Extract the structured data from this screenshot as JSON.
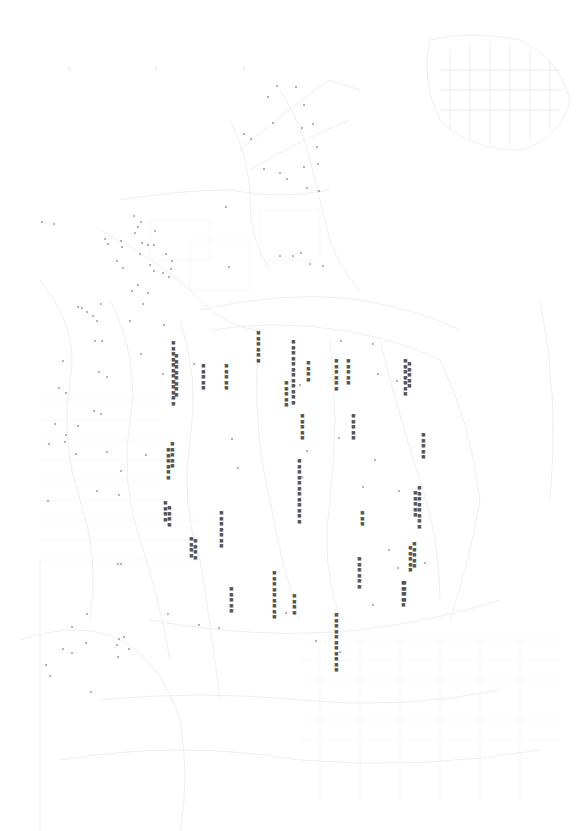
{
  "map": {
    "title": "",
    "background": "#ffffff",
    "line_color": "#e4e4e4",
    "text_color": "#555555",
    "marker_color": "#9a9a9a",
    "top_ticks": [
      {
        "x": 68,
        "y": 66,
        "text": "┼"
      },
      {
        "x": 155,
        "y": 66,
        "text": "┼"
      },
      {
        "x": 243,
        "y": 66,
        "text": "┼"
      }
    ],
    "labels": [
      {
        "x": 171,
        "y": 340,
        "text": "■■■■■■■■■■■■"
      },
      {
        "x": 174,
        "y": 353,
        "text": "■■■■■■■■"
      },
      {
        "x": 201,
        "y": 363,
        "text": "■■■■■"
      },
      {
        "x": 224,
        "y": 363,
        "text": "■■■■■"
      },
      {
        "x": 256,
        "y": 330,
        "text": "■■■■■■"
      },
      {
        "x": 284,
        "y": 380,
        "text": "■■■■■"
      },
      {
        "x": 291,
        "y": 339,
        "text": "■■■■■■■■■■■■"
      },
      {
        "x": 306,
        "y": 360,
        "text": "■■■■"
      },
      {
        "x": 300,
        "y": 413,
        "text": "■■■■■"
      },
      {
        "x": 334,
        "y": 358,
        "text": "■■■■■■"
      },
      {
        "x": 346,
        "y": 358,
        "text": "■■■■■"
      },
      {
        "x": 351,
        "y": 413,
        "text": "■■■■■"
      },
      {
        "x": 403,
        "y": 358,
        "text": "■■■■■■■"
      },
      {
        "x": 407,
        "y": 361,
        "text": "■■■■■"
      },
      {
        "x": 421,
        "y": 432,
        "text": "■■■■■"
      },
      {
        "x": 297,
        "y": 458,
        "text": "■■■■■■■■■■■■"
      },
      {
        "x": 417,
        "y": 485,
        "text": "■■■■■■■■"
      },
      {
        "x": 413,
        "y": 490,
        "text": "■■■■■"
      },
      {
        "x": 412,
        "y": 541,
        "text": "■■■■■"
      },
      {
        "x": 408,
        "y": 545,
        "text": "■■■■■"
      },
      {
        "x": 360,
        "y": 510,
        "text": "■■■"
      },
      {
        "x": 357,
        "y": 556,
        "text": "■■■■■■"
      },
      {
        "x": 401,
        "y": 580,
        "text": "■■■■■"
      },
      {
        "x": 166,
        "y": 447,
        "text": "■■■■■■"
      },
      {
        "x": 170,
        "y": 441,
        "text": "■■■■■"
      },
      {
        "x": 167,
        "y": 505,
        "text": "■■■■"
      },
      {
        "x": 163,
        "y": 500,
        "text": "■■■■"
      },
      {
        "x": 219,
        "y": 510,
        "text": "■■■■■■■"
      },
      {
        "x": 193,
        "y": 538,
        "text": "■■■■"
      },
      {
        "x": 189,
        "y": 536,
        "text": "■■■■"
      },
      {
        "x": 272,
        "y": 570,
        "text": "■■■■■■■■■"
      },
      {
        "x": 229,
        "y": 586,
        "text": "■■■■■"
      },
      {
        "x": 292,
        "y": 593,
        "text": "■■■■"
      },
      {
        "x": 334,
        "y": 612,
        "text": "■■■■■■■■■■■"
      },
      {
        "x": 402,
        "y": 580,
        "text": "■■■■"
      }
    ],
    "markers": [
      {
        "x": 276,
        "y": 85
      },
      {
        "x": 295,
        "y": 86
      },
      {
        "x": 267,
        "y": 96
      },
      {
        "x": 303,
        "y": 104
      },
      {
        "x": 272,
        "y": 122
      },
      {
        "x": 301,
        "y": 127
      },
      {
        "x": 312,
        "y": 123
      },
      {
        "x": 243,
        "y": 133
      },
      {
        "x": 250,
        "y": 138
      },
      {
        "x": 316,
        "y": 146
      },
      {
        "x": 263,
        "y": 168
      },
      {
        "x": 303,
        "y": 166
      },
      {
        "x": 317,
        "y": 163
      },
      {
        "x": 279,
        "y": 172
      },
      {
        "x": 286,
        "y": 178
      },
      {
        "x": 306,
        "y": 187
      },
      {
        "x": 318,
        "y": 190
      },
      {
        "x": 225,
        "y": 206
      },
      {
        "x": 279,
        "y": 255
      },
      {
        "x": 292,
        "y": 255
      },
      {
        "x": 300,
        "y": 252
      },
      {
        "x": 309,
        "y": 263
      },
      {
        "x": 322,
        "y": 265
      },
      {
        "x": 228,
        "y": 266
      },
      {
        "x": 41,
        "y": 221
      },
      {
        "x": 53,
        "y": 223
      },
      {
        "x": 133,
        "y": 215
      },
      {
        "x": 140,
        "y": 221
      },
      {
        "x": 137,
        "y": 226
      },
      {
        "x": 134,
        "y": 232
      },
      {
        "x": 154,
        "y": 230
      },
      {
        "x": 104,
        "y": 238
      },
      {
        "x": 107,
        "y": 243
      },
      {
        "x": 120,
        "y": 240
      },
      {
        "x": 141,
        "y": 242
      },
      {
        "x": 147,
        "y": 244
      },
      {
        "x": 153,
        "y": 244
      },
      {
        "x": 121,
        "y": 246
      },
      {
        "x": 139,
        "y": 253
      },
      {
        "x": 165,
        "y": 253
      },
      {
        "x": 116,
        "y": 260
      },
      {
        "x": 122,
        "y": 267
      },
      {
        "x": 149,
        "y": 264
      },
      {
        "x": 171,
        "y": 260
      },
      {
        "x": 170,
        "y": 268
      },
      {
        "x": 153,
        "y": 270
      },
      {
        "x": 162,
        "y": 272
      },
      {
        "x": 168,
        "y": 276
      },
      {
        "x": 137,
        "y": 284
      },
      {
        "x": 131,
        "y": 290
      },
      {
        "x": 147,
        "y": 292
      },
      {
        "x": 100,
        "y": 303
      },
      {
        "x": 77,
        "y": 306
      },
      {
        "x": 142,
        "y": 303
      },
      {
        "x": 81,
        "y": 307
      },
      {
        "x": 86,
        "y": 311
      },
      {
        "x": 92,
        "y": 315
      },
      {
        "x": 96,
        "y": 320
      },
      {
        "x": 129,
        "y": 320
      },
      {
        "x": 163,
        "y": 324
      },
      {
        "x": 94,
        "y": 340
      },
      {
        "x": 101,
        "y": 340
      },
      {
        "x": 140,
        "y": 353
      },
      {
        "x": 62,
        "y": 360
      },
      {
        "x": 98,
        "y": 371
      },
      {
        "x": 106,
        "y": 376
      },
      {
        "x": 58,
        "y": 387
      },
      {
        "x": 65,
        "y": 392
      },
      {
        "x": 93,
        "y": 410
      },
      {
        "x": 100,
        "y": 413
      },
      {
        "x": 54,
        "y": 423
      },
      {
        "x": 77,
        "y": 425
      },
      {
        "x": 65,
        "y": 434
      },
      {
        "x": 48,
        "y": 443
      },
      {
        "x": 64,
        "y": 441
      },
      {
        "x": 75,
        "y": 453
      },
      {
        "x": 106,
        "y": 451
      },
      {
        "x": 145,
        "y": 454
      },
      {
        "x": 120,
        "y": 470
      },
      {
        "x": 96,
        "y": 490
      },
      {
        "x": 118,
        "y": 494
      },
      {
        "x": 47,
        "y": 500
      },
      {
        "x": 162,
        "y": 373
      },
      {
        "x": 193,
        "y": 363
      },
      {
        "x": 231,
        "y": 438
      },
      {
        "x": 237,
        "y": 467
      },
      {
        "x": 301,
        "y": 476
      },
      {
        "x": 306,
        "y": 450
      },
      {
        "x": 299,
        "y": 384
      },
      {
        "x": 340,
        "y": 340
      },
      {
        "x": 338,
        "y": 437
      },
      {
        "x": 372,
        "y": 343
      },
      {
        "x": 377,
        "y": 373
      },
      {
        "x": 374,
        "y": 459
      },
      {
        "x": 362,
        "y": 486
      },
      {
        "x": 396,
        "y": 380
      },
      {
        "x": 398,
        "y": 490
      },
      {
        "x": 388,
        "y": 549
      },
      {
        "x": 397,
        "y": 567
      },
      {
        "x": 424,
        "y": 562
      },
      {
        "x": 372,
        "y": 604
      },
      {
        "x": 285,
        "y": 612
      },
      {
        "x": 315,
        "y": 640
      },
      {
        "x": 339,
        "y": 651
      },
      {
        "x": 167,
        "y": 613
      },
      {
        "x": 198,
        "y": 624
      },
      {
        "x": 218,
        "y": 627
      },
      {
        "x": 123,
        "y": 636
      },
      {
        "x": 86,
        "y": 613
      },
      {
        "x": 71,
        "y": 626
      },
      {
        "x": 85,
        "y": 642
      },
      {
        "x": 62,
        "y": 648
      },
      {
        "x": 71,
        "y": 652
      },
      {
        "x": 45,
        "y": 664
      },
      {
        "x": 49,
        "y": 675
      },
      {
        "x": 90,
        "y": 691
      },
      {
        "x": 118,
        "y": 638
      },
      {
        "x": 128,
        "y": 648
      },
      {
        "x": 117,
        "y": 656
      },
      {
        "x": 116,
        "y": 644
      },
      {
        "x": 117,
        "y": 563
      },
      {
        "x": 120,
        "y": 563
      }
    ]
  }
}
